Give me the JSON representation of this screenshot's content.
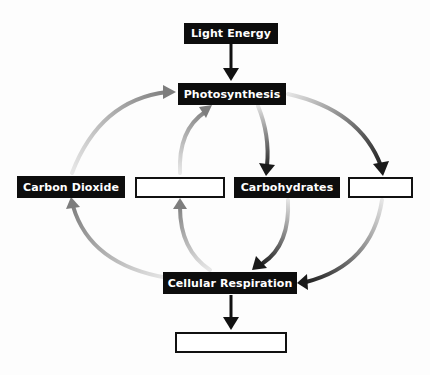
{
  "diagram": {
    "nodes": {
      "light_energy": {
        "label": "Light Energy",
        "style": "filled"
      },
      "photosynthesis": {
        "label": "Photosynthesis",
        "style": "filled"
      },
      "carbon_dioxide": {
        "label": "Carbon Dioxide",
        "style": "filled"
      },
      "blank_left": {
        "label": "",
        "style": "blank"
      },
      "carbohydrates": {
        "label": "Carbohydrates",
        "style": "filled"
      },
      "blank_right": {
        "label": "",
        "style": "blank"
      },
      "cellular_respiration": {
        "label": "Cellular Respiration",
        "style": "filled"
      },
      "blank_bottom": {
        "label": "",
        "style": "blank"
      }
    },
    "edges": [
      {
        "from": "Light Energy",
        "to": "Photosynthesis"
      },
      {
        "from": "Carbon Dioxide",
        "to": "Photosynthesis"
      },
      {
        "from": "blank_left",
        "to": "Photosynthesis"
      },
      {
        "from": "Photosynthesis",
        "to": "Carbohydrates"
      },
      {
        "from": "Photosynthesis",
        "to": "blank_right"
      },
      {
        "from": "Cellular Respiration",
        "to": "Carbon Dioxide"
      },
      {
        "from": "Cellular Respiration",
        "to": "blank_left"
      },
      {
        "from": "Carbohydrates",
        "to": "Cellular Respiration"
      },
      {
        "from": "blank_right",
        "to": "Cellular Respiration"
      },
      {
        "from": "Cellular Respiration",
        "to": "blank_bottom"
      }
    ],
    "colors": {
      "box_fill": "#0d0d0d",
      "box_text": "#ffffff",
      "arrow_dark": "#1a1a1a",
      "arrow_gray": "#8a8a8a",
      "arrow_light": "#d8d8d8"
    }
  }
}
